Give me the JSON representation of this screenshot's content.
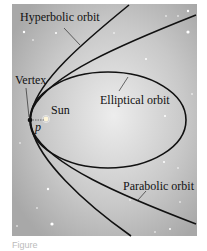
{
  "figure": {
    "labels": {
      "hyperbolic": "Hyperbolic orbit",
      "elliptical": "Elliptical orbit",
      "parabolic": "Parabolic orbit",
      "vertex": "Vertex",
      "sun": "Sun",
      "p": "p"
    },
    "caption": "Figure",
    "colors": {
      "background_light": "#e4e4e4",
      "background_dark": "#a9a9a9",
      "curve": "#111111"
    }
  }
}
